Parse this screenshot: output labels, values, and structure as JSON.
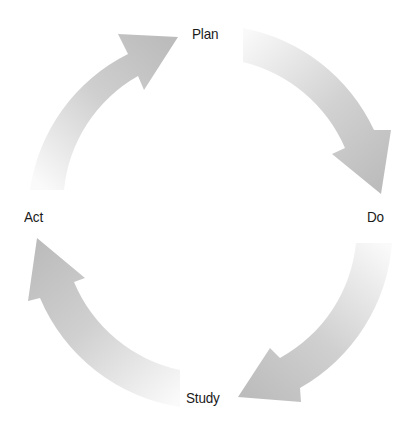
{
  "diagram": {
    "type": "cycle",
    "title": "",
    "stages": [
      {
        "id": "plan",
        "label": "Plan"
      },
      {
        "id": "do",
        "label": "Do"
      },
      {
        "id": "study",
        "label": "Study"
      },
      {
        "id": "act",
        "label": "Act"
      }
    ],
    "arrows": [
      {
        "from": "act",
        "to": "plan"
      },
      {
        "from": "plan",
        "to": "do"
      },
      {
        "from": "do",
        "to": "study"
      },
      {
        "from": "study",
        "to": "act"
      }
    ],
    "colors": {
      "arrow_dark": "#bdbdbd",
      "arrow_light": "#f7f7f7",
      "text": "#1a1a1a",
      "background": "#ffffff"
    }
  }
}
